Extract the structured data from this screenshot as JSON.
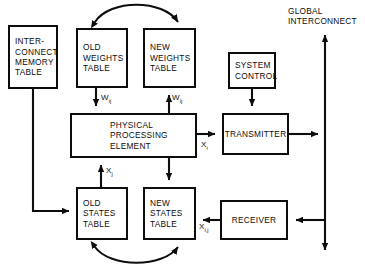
{
  "diagram": {
    "canvas": {
      "width": 365,
      "height": 270
    },
    "style": {
      "line_color": "#0d0d0d",
      "background": "#ffffff"
    },
    "nodes": [
      {
        "id": "interconnect-memory-table",
        "lines": [
          "INTER-",
          "CONNECT",
          "MEMORY",
          "TABLE"
        ],
        "x": 8,
        "y": 25,
        "w": 50,
        "h": 64
      },
      {
        "id": "old-weights-table",
        "lines": [
          "OLD",
          "WEIGHTS",
          "TABLE"
        ],
        "x": 76,
        "y": 28,
        "w": 52,
        "h": 60
      },
      {
        "id": "new-weights-table",
        "lines": [
          "NEW",
          "WEIGHTS",
          "TABLE"
        ],
        "x": 143,
        "y": 28,
        "w": 53,
        "h": 60
      },
      {
        "id": "system-control",
        "lines": [
          "SYSTEM",
          "CONTROL"
        ],
        "x": 228,
        "y": 52,
        "w": 48,
        "h": 37
      },
      {
        "id": "physical-processing-element",
        "lines": [
          "PHYSICAL",
          "PROCESSING",
          "ELEMENT"
        ],
        "x": 70,
        "y": 113,
        "w": 127,
        "h": 45
      },
      {
        "id": "transmitter",
        "lines": [
          "TRANSMITTER"
        ],
        "x": 222,
        "y": 113,
        "w": 67,
        "h": 42
      },
      {
        "id": "old-states-table",
        "lines": [
          "OLD",
          "STATES",
          "TABLE"
        ],
        "x": 76,
        "y": 187,
        "w": 52,
        "h": 53
      },
      {
        "id": "new-states-table",
        "lines": [
          "NEW",
          "STATES",
          "TABLE"
        ],
        "x": 143,
        "y": 187,
        "w": 53,
        "h": 53
      },
      {
        "id": "receiver",
        "lines": [
          "RECEIVER"
        ],
        "x": 220,
        "y": 200,
        "w": 68,
        "h": 40
      }
    ],
    "global_interconnect": {
      "lines": [
        "GLOBAL",
        "INTERCONNECT"
      ],
      "x": 288,
      "y": 6
    },
    "edge_labels": [
      {
        "id": "w-ij-old",
        "base": "W",
        "sub": "ij",
        "x": 101,
        "y": 93
      },
      {
        "id": "w-ij-new",
        "base": "W",
        "sub": "ij",
        "x": 172,
        "y": 93
      },
      {
        "id": "x-j-ppe",
        "base": "X",
        "sub": "j",
        "x": 106,
        "y": 166
      },
      {
        "id": "x-i-tx",
        "base": "X",
        "sub": "i",
        "x": 201,
        "y": 140
      },
      {
        "id": "x-i-j-rx",
        "base": "X",
        "sub": "i,j",
        "x": 199,
        "y": 222
      }
    ],
    "connections": [
      {
        "id": "weights-swap-arc",
        "from": "old-weights-table",
        "to": "new-weights-table",
        "kind": "curved-bidirectional"
      },
      {
        "id": "states-swap-arc",
        "from": "old-states-table",
        "to": "new-states-table",
        "kind": "curved-bidirectional"
      },
      {
        "id": "old-weights-to-ppe",
        "from": "old-weights-table",
        "to": "physical-processing-element",
        "kind": "arrow-down"
      },
      {
        "id": "ppe-to-new-weights",
        "from": "physical-processing-element",
        "to": "new-weights-table",
        "kind": "arrow-up"
      },
      {
        "id": "old-states-to-ppe",
        "from": "old-states-table",
        "to": "physical-processing-element",
        "kind": "arrow-up"
      },
      {
        "id": "ppe-to-new-states",
        "from": "physical-processing-element",
        "to": "new-states-table",
        "kind": "arrow-down"
      },
      {
        "id": "system-control-to-transmitter",
        "from": "system-control",
        "to": "transmitter",
        "kind": "arrow-down"
      },
      {
        "id": "ppe-to-transmitter",
        "from": "physical-processing-element",
        "to": "transmitter",
        "kind": "arrow-right"
      },
      {
        "id": "transmitter-to-global",
        "from": "transmitter",
        "to": "global-interconnect",
        "kind": "arrow-right"
      },
      {
        "id": "global-to-receiver",
        "from": "global-interconnect",
        "to": "receiver",
        "kind": "arrow-left"
      },
      {
        "id": "receiver-to-new-states",
        "from": "receiver",
        "to": "new-states-table",
        "kind": "arrow-left"
      },
      {
        "id": "memory-to-old-states",
        "from": "interconnect-memory-table",
        "to": "old-states-table",
        "kind": "elbow-arrow-right"
      },
      {
        "id": "global-bus-up",
        "from": "global-interconnect",
        "to": "global-interconnect",
        "kind": "arrow-up"
      },
      {
        "id": "global-bus-down",
        "from": "global-interconnect",
        "to": "global-interconnect",
        "kind": "arrow-down"
      }
    ]
  }
}
